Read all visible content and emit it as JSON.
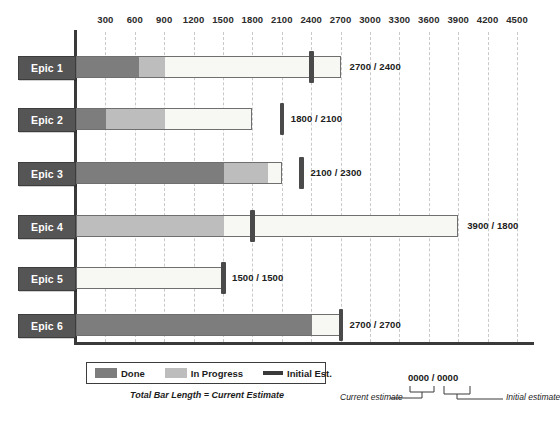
{
  "chart_data": {
    "type": "bar",
    "title": "",
    "xlabel": "",
    "ylabel": "",
    "orientation": "horizontal",
    "stacked": true,
    "grid": true,
    "xlim": [
      0,
      4650
    ],
    "ticks": [
      300,
      600,
      900,
      1200,
      1500,
      1800,
      2100,
      2400,
      2700,
      3000,
      3300,
      3600,
      3900,
      4200,
      4500
    ],
    "categories": [
      "Epic 1",
      "Epic 2",
      "Epic 3",
      "Epic 4",
      "Epic 5",
      "Epic 6"
    ],
    "series": [
      {
        "name": "Done",
        "color": "#7d7d7d",
        "values": [
          630,
          300,
          1500,
          0,
          0,
          2400
        ]
      },
      {
        "name": "In Progress",
        "color": "#bdbdbd",
        "values": [
          270,
          600,
          450,
          1500,
          0,
          0
        ]
      },
      {
        "name": "Remaining",
        "color": "#f7f7f4",
        "values": [
          1800,
          900,
          150,
          2400,
          1500,
          300
        ]
      }
    ],
    "current_estimate": [
      2700,
      1800,
      2100,
      3900,
      1500,
      2700
    ],
    "initial_estimate": [
      2400,
      2100,
      2300,
      1800,
      1500,
      2700
    ],
    "legend": {
      "position": "bottom-left",
      "entries": [
        {
          "label": "Done",
          "swatch": "done"
        },
        {
          "label": "In Progress",
          "swatch": "progress"
        },
        {
          "label": "Initial Est.",
          "swatch": "est"
        }
      ]
    },
    "annotations": [
      "Total Bar Length = Current Estimate",
      "0000 / 0000",
      "Current estimate",
      "Initial estimate"
    ]
  },
  "axis": {
    "tick_labels": [
      "300",
      "600",
      "900",
      "1200",
      "1500",
      "1800",
      "2100",
      "2400",
      "2700",
      "3000",
      "3300",
      "3600",
      "3900",
      "4200",
      "4500"
    ]
  },
  "rows": [
    {
      "label": "Epic 1",
      "value_label": "2700 / 2400"
    },
    {
      "label": "Epic 2",
      "value_label": "1800 / 2100"
    },
    {
      "label": "Epic 3",
      "value_label": "2100 / 2300"
    },
    {
      "label": "Epic 4",
      "value_label": "3900 / 1800"
    },
    {
      "label": "Epic 5",
      "value_label": "1500 / 1500"
    },
    {
      "label": "Epic 6",
      "value_label": "2700 / 2700"
    }
  ],
  "legend": {
    "done_label": "Done",
    "progress_label": "In Progress",
    "est_label": "Initial Est."
  },
  "caption": "Total Bar Length = Current Estimate",
  "callout": {
    "value": "0000 / 0000",
    "left_text": "Current estimate",
    "right_text": "Initial estimate"
  },
  "colors": {
    "done": "#7d7d7d",
    "in_progress": "#bdbdbd",
    "remaining": "#f7f7f4",
    "marker": "#4a4a4a",
    "label_box": "#555555",
    "axis": "#3a3a3a",
    "grid": "#c9c9c9"
  }
}
